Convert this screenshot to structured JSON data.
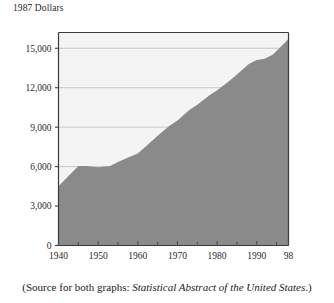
{
  "axis_title": "1987 Dollars",
  "caption": {
    "prefix": "(Source for both graphs: ",
    "source_italic": "Statistical Abstract of the United States",
    "suffix": ".)"
  },
  "colors": {
    "area_fill": "#8a8a8a",
    "plot_background": "#f4f4f4",
    "axis_line": "#3a3a3a",
    "gridline": "#c8c8c8",
    "text": "#2a2a2a"
  },
  "chart_data": {
    "type": "area",
    "title": "1987 Dollars",
    "xlabel": "",
    "ylabel": "1987 Dollars",
    "xlim": [
      1940,
      1998
    ],
    "ylim": [
      0,
      16200
    ],
    "grid": true,
    "legend": "none",
    "ytick_labels": [
      "0",
      "3,000",
      "6,000",
      "9,000",
      "12,000",
      "15,000"
    ],
    "ytick_values": [
      0,
      3000,
      6000,
      9000,
      12000,
      15000
    ],
    "xtick_labels": [
      "1940",
      "1950",
      "1960",
      "1970",
      "1980",
      "1990",
      "98"
    ],
    "xtick_values": [
      1940,
      1950,
      1960,
      1970,
      1980,
      1990,
      1998
    ],
    "xminor_tick_values": [
      1945,
      1955,
      1965,
      1975,
      1985,
      1995
    ],
    "x": [
      1940,
      1945,
      1947,
      1950,
      1953,
      1955,
      1958,
      1960,
      1963,
      1965,
      1968,
      1970,
      1973,
      1975,
      1978,
      1980,
      1983,
      1985,
      1988,
      1990,
      1992,
      1994,
      1996,
      1998
    ],
    "values": [
      4500,
      6050,
      6050,
      5950,
      6050,
      6350,
      6750,
      7000,
      7800,
      8350,
      9100,
      9500,
      10300,
      10700,
      11400,
      11800,
      12500,
      13000,
      13800,
      14100,
      14200,
      14500,
      15100,
      15700
    ],
    "series": [
      {
        "name": "Dollars (1987 constant)",
        "values": [
          4500,
          6050,
          6050,
          5950,
          6050,
          6350,
          6750,
          7000,
          7800,
          8350,
          9100,
          9500,
          10300,
          10700,
          11400,
          11800,
          12500,
          13000,
          13800,
          14100,
          14200,
          14500,
          15100,
          15700
        ]
      }
    ]
  }
}
